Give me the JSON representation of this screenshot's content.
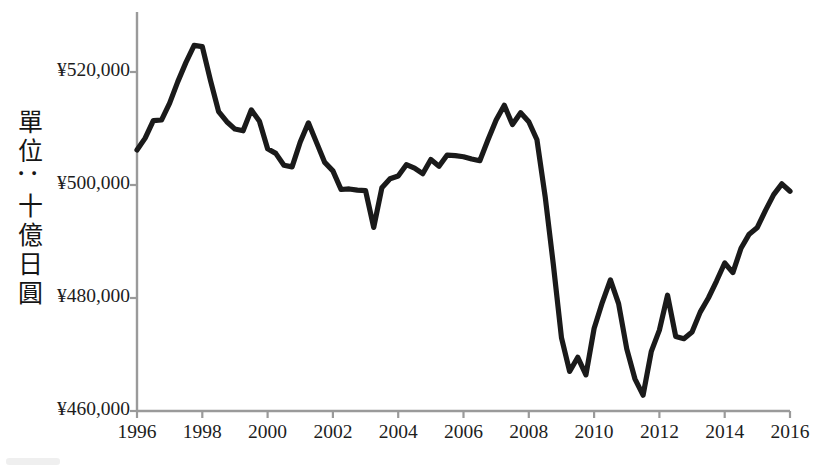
{
  "chart_data": {
    "type": "line",
    "title": "",
    "subtitle": "",
    "xlabel": "",
    "ylabel": "單位：十億日圓",
    "ylabel_chars": [
      "單",
      "位",
      "：",
      "十",
      "億",
      "日",
      "圓"
    ],
    "xlim": [
      1996,
      2016
    ],
    "ylim": [
      460000,
      527000
    ],
    "y_axis_start": 460000,
    "grid": false,
    "legend": null,
    "legend_position": "none",
    "line_color": "#1a1a1a",
    "axis_color": "#9a9a9a",
    "text_color": "#1d1d1d",
    "background_color": "#ffffff",
    "yticks": [
      460000,
      480000,
      500000,
      520000
    ],
    "ytick_labels": [
      "¥460,000",
      "¥480,000",
      "¥500,000",
      "¥520,000"
    ],
    "xticks": [
      1996,
      1998,
      2000,
      2002,
      2004,
      2006,
      2008,
      2010,
      2012,
      2014,
      2016
    ],
    "xtick_labels": [
      "1996",
      "1998",
      "2000",
      "2002",
      "2004",
      "2006",
      "2008",
      "2010",
      "2012",
      "2014",
      "2016"
    ],
    "series_name": "Japan real GDP (quarterly)",
    "x": [
      1996.0,
      1996.25,
      1996.5,
      1996.75,
      1997.0,
      1997.25,
      1997.5,
      1997.75,
      1998.0,
      1998.25,
      1998.5,
      1998.75,
      1999.0,
      1999.25,
      1999.5,
      1999.75,
      2000.0,
      2000.25,
      2000.5,
      2000.75,
      2001.0,
      2001.25,
      2001.5,
      2001.75,
      2002.0,
      2002.25,
      2002.5,
      2002.75,
      2003.0,
      2003.25,
      2003.5,
      2003.75,
      2004.0,
      2004.25,
      2004.5,
      2004.75,
      2005.0,
      2005.25,
      2005.5,
      2005.75,
      2006.0,
      2006.25,
      2006.5,
      2006.75,
      2007.0,
      2007.25,
      2007.5,
      2007.75,
      2008.0,
      2008.25,
      2008.5,
      2008.75,
      2009.0,
      2009.25,
      2009.5,
      2009.75,
      2010.0,
      2010.25,
      2010.5,
      2010.75,
      2011.0,
      2011.25,
      2011.5,
      2011.75,
      2012.0,
      2012.25,
      2012.5,
      2012.75,
      2013.0,
      2013.25,
      2013.5,
      2013.75,
      2014.0,
      2014.25,
      2014.5,
      2014.75,
      2015.0,
      2015.25,
      2015.5,
      2015.75,
      2016.0
    ],
    "values": [
      506200,
      508300,
      511400,
      511500,
      514500,
      518300,
      521700,
      524700,
      524500,
      518500,
      513000,
      511200,
      509900,
      509600,
      513300,
      511300,
      506400,
      505600,
      503500,
      503200,
      507600,
      511000,
      507500,
      504000,
      502500,
      499200,
      499300,
      499100,
      499000,
      492500,
      499500,
      501100,
      501600,
      503600,
      503000,
      502000,
      504500,
      503300,
      505300,
      505200,
      505000,
      504600,
      504300,
      508000,
      511500,
      514100,
      510700,
      512800,
      511200,
      508000,
      498000,
      486000,
      473000,
      467000,
      469500,
      466400,
      474600,
      479200,
      483200,
      479000,
      471000,
      465700,
      462800,
      470500,
      474300,
      480500,
      473200,
      472800,
      474000,
      477500,
      480000,
      483000,
      486200,
      484500,
      488800,
      491300,
      492500,
      495500,
      498300,
      500200,
      498900
    ],
    "annotations": []
  },
  "geometry": {
    "plot_left": 137,
    "plot_right": 790,
    "y_at_460000": 411,
    "y_at_520000": 72
  }
}
